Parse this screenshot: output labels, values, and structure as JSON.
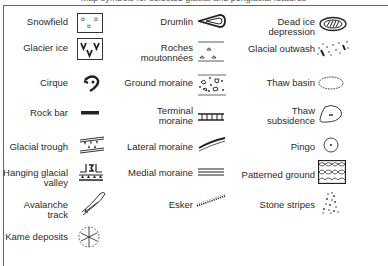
{
  "title": "Map symbols for selected glacial and periglacial features",
  "legend": {
    "col1": [
      {
        "label": "Snowfield",
        "icon": "snowfield-icon"
      },
      {
        "label": "Glacier ice",
        "icon": "glacier-ice-icon"
      },
      {
        "label": "Cirque",
        "icon": "cirque-icon"
      },
      {
        "label": "Rock bar",
        "icon": "rock-bar-icon"
      },
      {
        "label": "Glacial trough",
        "icon": "glacial-trough-icon"
      },
      {
        "label": "Hanging glacial valley",
        "icon": "hanging-valley-icon"
      },
      {
        "label": "Avalanche track",
        "icon": "avalanche-track-icon"
      },
      {
        "label": "Kame deposits",
        "icon": "kame-deposits-icon"
      }
    ],
    "col2": [
      {
        "label": "Drumlin",
        "icon": "drumlin-icon"
      },
      {
        "label": "Roches moutonnées",
        "icon": "roches-moutonnees-icon"
      },
      {
        "label": "Ground moraine",
        "icon": "ground-moraine-icon"
      },
      {
        "label": "Terminal moraine",
        "icon": "terminal-moraine-icon"
      },
      {
        "label": "Lateral moraine",
        "icon": "lateral-moraine-icon"
      },
      {
        "label": "Medial moraine",
        "icon": "medial-moraine-icon"
      },
      {
        "label": "Esker",
        "icon": "esker-icon"
      }
    ],
    "col3": [
      {
        "label": "Dead ice depression",
        "icon": "dead-ice-depression-icon"
      },
      {
        "label": "Glacial outwash",
        "icon": "glacial-outwash-icon"
      },
      {
        "label": "Thaw basin",
        "icon": "thaw-basin-icon"
      },
      {
        "label": "Thaw subsidence",
        "icon": "thaw-subsidence-icon"
      },
      {
        "label": "Pingo",
        "icon": "pingo-icon"
      },
      {
        "label": "Patterned ground",
        "icon": "patterned-ground-icon"
      },
      {
        "label": "Stone stripes",
        "icon": "stone-stripes-icon"
      }
    ]
  }
}
